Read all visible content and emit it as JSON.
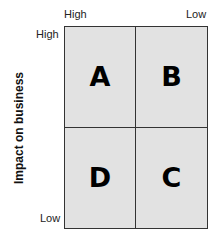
{
  "x_axis": {
    "high_label": "High",
    "low_label": "Low"
  },
  "y_axis": {
    "title": "Impact on business",
    "high_label": "High",
    "low_label": "Low"
  },
  "quadrants": {
    "top_left": "A",
    "top_right": "B",
    "bottom_left": "D",
    "bottom_right": "C"
  },
  "colors": {
    "cell_fill": "#e2e2e2",
    "border": "#333333",
    "letter": "#000000"
  }
}
